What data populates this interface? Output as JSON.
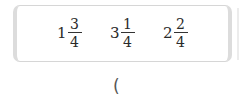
{
  "numbers": [
    {
      "whole": "1",
      "numerator": "3",
      "denominator": "4"
    },
    {
      "whole": "3",
      "numerator": "1",
      "denominator": "4"
    },
    {
      "whole": "2",
      "numerator": "2",
      "denominator": "4"
    }
  ],
  "answer": {
    "open_paren": "("
  }
}
